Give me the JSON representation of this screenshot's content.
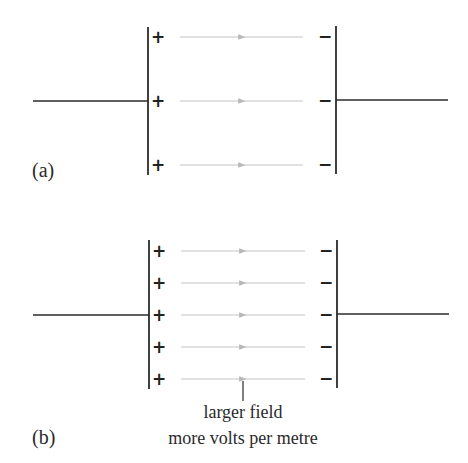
{
  "diagram": {
    "type": "parallel-plate-capacitor-field-comparison",
    "colors": {
      "plate": "#2b2b2b",
      "wire": "#2b2b2b",
      "field_line": "#c4c4c4",
      "arrowhead": "#b8b8b8",
      "text": "#2a2a2a"
    },
    "panels": [
      {
        "id": "a",
        "label": "(a)",
        "positive_plate_sign": "+",
        "negative_plate_sign": "−",
        "field_line_count": 3,
        "field_direction": "left-to-right (positive to negative)"
      },
      {
        "id": "b",
        "label": "(b)",
        "positive_plate_sign": "+",
        "negative_plate_sign": "−",
        "field_line_count": 5,
        "field_direction": "left-to-right (positive to negative)",
        "annotation": {
          "line1": "larger field",
          "line2": "more volts per metre"
        }
      }
    ]
  },
  "signs": {
    "plus": "+",
    "minus": "−"
  }
}
